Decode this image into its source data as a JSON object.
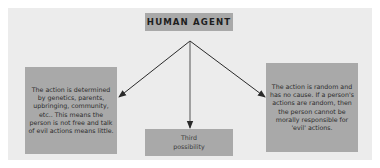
{
  "diagram": {
    "title": "HUMAN AGENT",
    "nodes": {
      "left": "The action is determined by genetics, parents, upbringing, community, etc.. This means the person is not free and talk of evil actions means little.",
      "middle": "Third possibility",
      "right": "The action is random and has no cause. If a person's actions are random, then the person cannot be morally responsible for 'evil' actions."
    },
    "edges": [
      {
        "from": "title",
        "to": "left"
      },
      {
        "from": "title",
        "to": "middle"
      },
      {
        "from": "title",
        "to": "right"
      }
    ],
    "colors": {
      "panel": "#ececec",
      "box": "#a9a9a9",
      "arrow": "#2a2a2a",
      "background": "#ffffff"
    }
  }
}
